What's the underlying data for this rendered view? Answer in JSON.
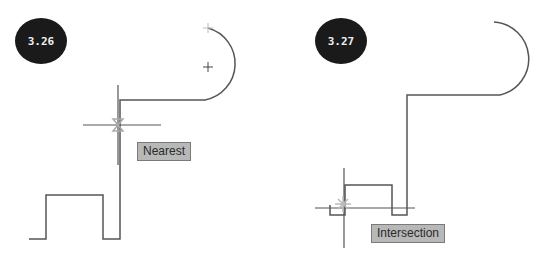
{
  "figures": [
    {
      "id": "3.26",
      "snap_label": "Nearest"
    },
    {
      "id": "3.27",
      "snap_label": "Intersection"
    }
  ],
  "colors": {
    "line": "#555555",
    "badge": "#1a1a1a",
    "tooltip_bg": "#b8b8b8",
    "marker": "#aaaaaa"
  }
}
